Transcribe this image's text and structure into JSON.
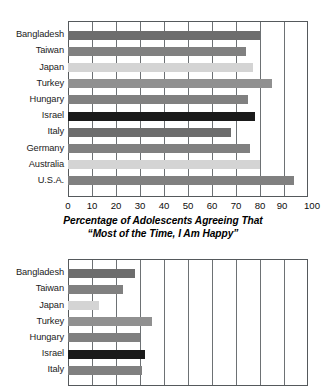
{
  "figure": {
    "axis_title_line1": "Percentage of Adolescents Agreeing That",
    "axis_title_line2": "“Most of the Time, I Am Happy”"
  },
  "palette": {
    "dark_gray": "#6d6d6d",
    "mid_gray": "#808080",
    "light_gray": "#d4d4d4",
    "medium_gray": "#909090",
    "black": "#1a1a1a",
    "frame": "#55595c",
    "grid": "#6d7174"
  },
  "chart_data": [
    {
      "id": "top",
      "type": "bar",
      "orientation": "horizontal",
      "title": "Percentage of Adolescents Agreeing That “Most of the Time, I Am Happy”",
      "xlabel": "",
      "ylabel": "",
      "xlim": [
        0,
        100
      ],
      "xticks": [
        0,
        10,
        20,
        30,
        40,
        50,
        60,
        70,
        80,
        90,
        100
      ],
      "tick_labels": [
        "0",
        "10",
        "20",
        "30",
        "40",
        "50",
        "60",
        "70",
        "80",
        "90",
        "100"
      ],
      "grid": true,
      "legend": "none",
      "categories": [
        "Bangladesh",
        "Taiwan",
        "Japan",
        "Turkey",
        "Hungary",
        "Israel",
        "Italy",
        "Germany",
        "Australia",
        "U.S.A."
      ],
      "values": [
        80,
        74,
        77,
        85,
        75,
        78,
        68,
        76,
        80,
        94
      ],
      "colors": [
        "#6d6d6d",
        "#808080",
        "#d4d4d4",
        "#909090",
        "#808080",
        "#1a1a1a",
        "#6d6d6d",
        "#808080",
        "#d4d4d4",
        "#808080"
      ]
    },
    {
      "id": "bottom",
      "type": "bar",
      "orientation": "horizontal",
      "title": "",
      "xlabel": "",
      "ylabel": "",
      "xlim": [
        0,
        100
      ],
      "xticks": [
        0,
        10,
        20,
        30,
        40,
        50,
        60,
        70,
        80,
        90,
        100
      ],
      "grid": true,
      "legend": "none",
      "categories": [
        "Bangladesh",
        "Taiwan",
        "Japan",
        "Turkey",
        "Hungary",
        "Israel",
        "Italy"
      ],
      "values": [
        28,
        23,
        13,
        35,
        30,
        32,
        31
      ],
      "colors": [
        "#6d6d6d",
        "#808080",
        "#d4d4d4",
        "#909090",
        "#808080",
        "#1a1a1a",
        "#808080"
      ],
      "note": "chart is cropped at the bottom edge of the screenshot"
    }
  ]
}
